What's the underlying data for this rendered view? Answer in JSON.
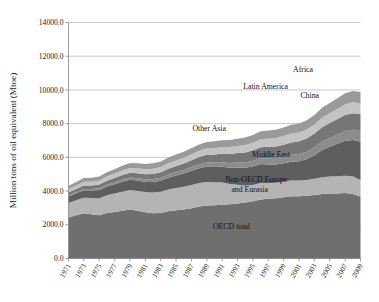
{
  "chart_data": {
    "type": "area",
    "stacked": true,
    "title": "",
    "xlabel": "",
    "ylabel": "Million tons of oil equivalent (Mtoe)",
    "ylim": [
      0,
      14000
    ],
    "ytick_labels": [
      "0.0",
      "2000.0",
      "4000.0",
      "6000.0",
      "8000.0",
      "10000.0",
      "12000.0",
      "14000.0"
    ],
    "ytick_values": [
      0,
      2000,
      4000,
      6000,
      8000,
      10000,
      12000,
      14000
    ],
    "grid": true,
    "grid_axis": "y",
    "legend_position": "inline-annotations",
    "x": [
      1971,
      1972,
      1973,
      1974,
      1975,
      1976,
      1977,
      1978,
      1979,
      1980,
      1981,
      1982,
      1983,
      1984,
      1985,
      1986,
      1987,
      1988,
      1989,
      1990,
      1991,
      1992,
      1993,
      1994,
      1995,
      1996,
      1997,
      1998,
      1999,
      2000,
      2001,
      2002,
      2003,
      2004,
      2005,
      2006,
      2007,
      2008,
      2009
    ],
    "xtick_labels": [
      "1971",
      "1973",
      "1975",
      "1977",
      "1979",
      "1981",
      "1983",
      "1985",
      "1987",
      "1989",
      "1991",
      "1993",
      "1995",
      "1997",
      "1999",
      "2001",
      "2003",
      "2005",
      "2007",
      "2009"
    ],
    "series": [
      {
        "name": "OECD total",
        "color": "#706f6f",
        "values": [
          2430,
          2560,
          2680,
          2620,
          2570,
          2700,
          2760,
          2830,
          2900,
          2830,
          2740,
          2690,
          2700,
          2800,
          2860,
          2900,
          2980,
          3080,
          3140,
          3160,
          3190,
          3220,
          3260,
          3320,
          3390,
          3500,
          3540,
          3570,
          3640,
          3700,
          3690,
          3720,
          3760,
          3830,
          3860,
          3850,
          3880,
          3830,
          3680
        ]
      },
      {
        "name": "Non-OECD Europe and Eurasia",
        "color": "#b4b4b4",
        "values": [
          860,
          890,
          930,
          970,
          1010,
          1050,
          1090,
          1130,
          1160,
          1180,
          1200,
          1230,
          1260,
          1290,
          1320,
          1350,
          1380,
          1400,
          1400,
          1370,
          1320,
          1200,
          1120,
          1010,
          970,
          980,
          940,
          920,
          930,
          930,
          940,
          940,
          970,
          990,
          1000,
          1030,
          1030,
          1050,
          980
        ]
      },
      {
        "name": "China",
        "color": "#5e5e5e",
        "values": [
          390,
          420,
          440,
          450,
          490,
          520,
          560,
          600,
          610,
          610,
          600,
          620,
          650,
          700,
          750,
          790,
          840,
          880,
          910,
          900,
          930,
          960,
          1010,
          1050,
          1100,
          1120,
          1100,
          1090,
          1080,
          1110,
          1140,
          1230,
          1400,
          1620,
          1770,
          1930,
          2080,
          2150,
          2260
        ]
      },
      {
        "name": "Middle East",
        "color": "#8c8c8c",
        "values": [
          60,
          70,
          80,
          85,
          95,
          105,
          115,
          125,
          135,
          145,
          155,
          165,
          180,
          190,
          200,
          215,
          225,
          235,
          250,
          260,
          275,
          290,
          305,
          320,
          335,
          350,
          365,
          385,
          400,
          415,
          435,
          450,
          470,
          500,
          525,
          550,
          580,
          610,
          630
        ]
      },
      {
        "name": "Other Asia",
        "color": "#767676",
        "values": [
          180,
          190,
          205,
          210,
          220,
          235,
          250,
          265,
          280,
          290,
          300,
          315,
          330,
          345,
          360,
          380,
          400,
          425,
          450,
          475,
          500,
          530,
          560,
          590,
          620,
          655,
          680,
          680,
          700,
          730,
          750,
          780,
          810,
          850,
          880,
          910,
          950,
          980,
          1000
        ]
      },
      {
        "name": "Latin America",
        "color": "#c3c3c3",
        "values": [
          190,
          200,
          215,
          225,
          235,
          250,
          260,
          275,
          290,
          300,
          305,
          310,
          315,
          325,
          330,
          345,
          355,
          365,
          375,
          385,
          395,
          410,
          425,
          440,
          455,
          475,
          490,
          500,
          510,
          525,
          525,
          530,
          540,
          565,
          585,
          605,
          630,
          650,
          650
        ]
      },
      {
        "name": "Africa",
        "color": "#9a9a9a",
        "values": [
          200,
          210,
          220,
          230,
          240,
          250,
          260,
          270,
          285,
          295,
          305,
          315,
          325,
          335,
          345,
          355,
          365,
          375,
          390,
          400,
          410,
          420,
          430,
          445,
          455,
          470,
          485,
          495,
          505,
          520,
          535,
          550,
          570,
          590,
          610,
          630,
          650,
          670,
          680
        ]
      }
    ],
    "annotations": [
      {
        "label": "Africa",
        "x": 313,
        "y": 72
      },
      {
        "label": "Latin America",
        "x": 288,
        "y": 89
      },
      {
        "label": "China",
        "x": 319,
        "y": 98
      },
      {
        "label": "Other Asia",
        "x": 226,
        "y": 131
      },
      {
        "label": "Middle East",
        "x": 290,
        "y": 157
      },
      {
        "label": "Non-OECD Europe",
        "x": 287,
        "y": 182
      },
      {
        "label": "and Eurasia",
        "x": 268,
        "y": 192
      },
      {
        "label": "OECD total",
        "x": 250,
        "y": 229
      }
    ]
  },
  "colors": {
    "background": "#ffffff",
    "grid": "#b0b0b0",
    "axis": "#888888",
    "text": "#1a1a1a"
  }
}
